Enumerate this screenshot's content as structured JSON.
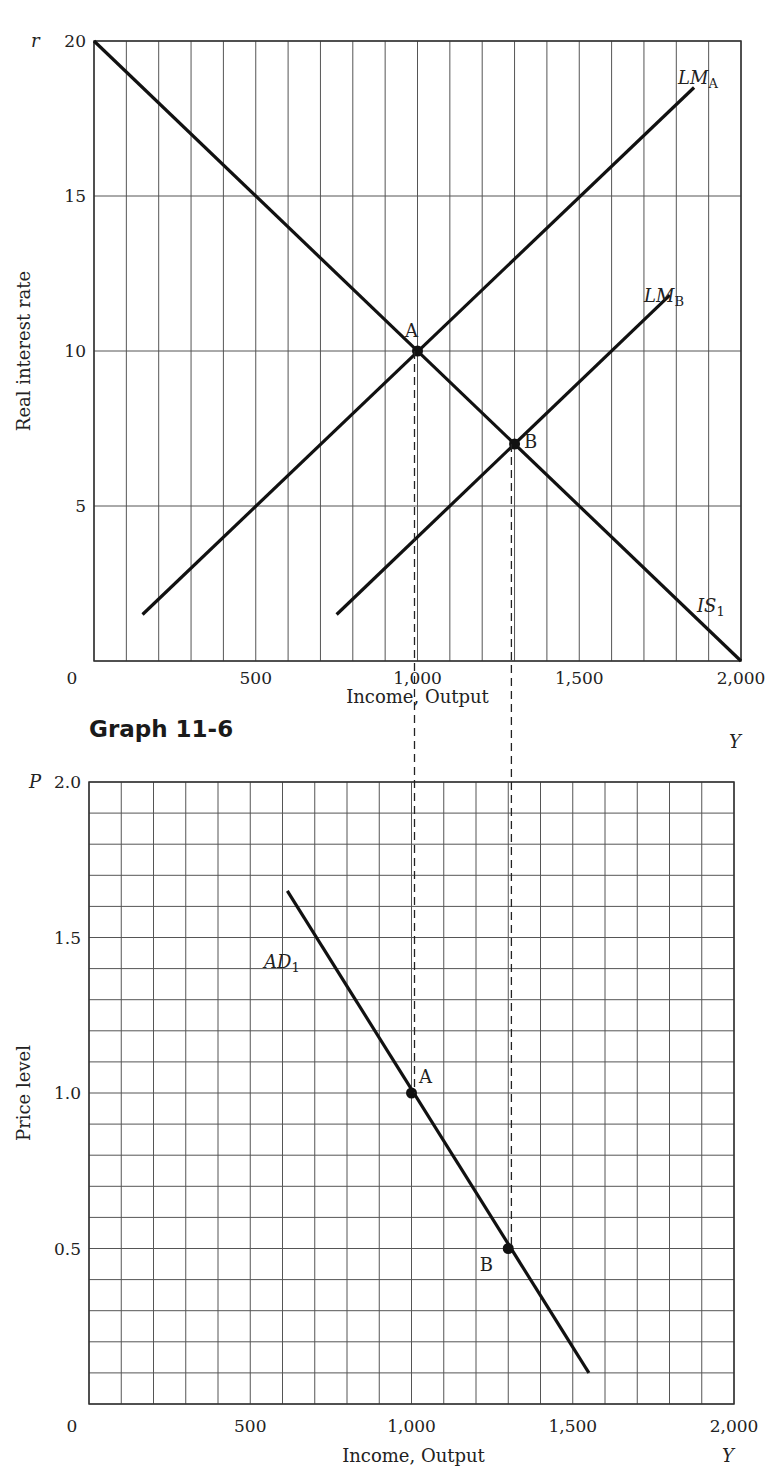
{
  "heading": "Graph 11-6",
  "chart_data": [
    {
      "type": "line",
      "title": "IS-LM",
      "xlabel": "Income, Output",
      "ylabel": "Real interest rate",
      "x_axis_symbol": "Y",
      "y_axis_symbol": "r",
      "xlim": [
        0,
        2000
      ],
      "ylim": [
        0,
        20
      ],
      "x_ticks": [
        0,
        500,
        1000,
        1500,
        2000
      ],
      "x_tick_labels": [
        "0",
        "500",
        "1,000",
        "1,500",
        "2,000"
      ],
      "y_ticks": [
        5,
        10,
        15,
        20
      ],
      "y_tick_labels": [
        "5",
        "10",
        "15",
        "20"
      ],
      "grid": {
        "x_step": 100,
        "y_step": 5
      },
      "series": [
        {
          "name": "IS1",
          "label_main": "IS",
          "label_sub": "1",
          "points": [
            [
              0,
              20
            ],
            [
              2000,
              0
            ]
          ]
        },
        {
          "name": "LMA",
          "label_main": "LM",
          "label_sub": "A",
          "points": [
            [
              150,
              1.5
            ],
            [
              1855,
              18.5
            ]
          ]
        },
        {
          "name": "LMB",
          "label_main": "LM",
          "label_sub": "B",
          "points": [
            [
              750,
              1.5
            ],
            [
              1780,
              11.8
            ]
          ]
        }
      ],
      "points": [
        {
          "label": "A",
          "x": 1000,
          "y": 10
        },
        {
          "label": "B",
          "x": 1300,
          "y": 7
        }
      ]
    },
    {
      "type": "line",
      "title": "Aggregate Demand",
      "xlabel": "Income, Output",
      "ylabel": "Price level",
      "x_axis_symbol": "Y",
      "y_axis_symbol": "P",
      "xlim": [
        0,
        2000
      ],
      "ylim": [
        0,
        2.0
      ],
      "x_ticks": [
        0,
        500,
        1000,
        1500,
        2000
      ],
      "x_tick_labels": [
        "0",
        "500",
        "1,000",
        "1,500",
        "2,000"
      ],
      "y_ticks": [
        0.5,
        1.0,
        1.5,
        2.0
      ],
      "y_tick_labels": [
        "0.5",
        "1.0",
        "1.5",
        "2.0"
      ],
      "grid": {
        "x_step": 100,
        "y_step": 0.1
      },
      "series": [
        {
          "name": "AD1",
          "label_main": "AD",
          "label_sub": "1",
          "points": [
            [
              615,
              1.65
            ],
            [
              1550,
              0.1
            ]
          ]
        }
      ],
      "points": [
        {
          "label": "A",
          "x": 1000,
          "y": 1.0
        },
        {
          "label": "B",
          "x": 1300,
          "y": 0.5
        }
      ]
    }
  ],
  "dashed_guides": [
    1000,
    1300
  ]
}
